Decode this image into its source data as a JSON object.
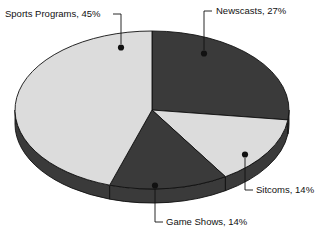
{
  "chart_data": {
    "type": "pie",
    "title": "",
    "categories": [
      "Newscasts",
      "Sitcoms",
      "Game Shows",
      "Sports Programs"
    ],
    "values": [
      27,
      14,
      14,
      45
    ],
    "unit": "%",
    "legend": "none",
    "labels_position": "outside-with-leader-lines",
    "style": "3d-pie",
    "slices": [
      {
        "name": "Newscasts",
        "value": 27,
        "label": "Newscasts, 27%",
        "color": "#3a3a3a",
        "start_angle_deg": 0,
        "end_angle_deg": 97.2
      },
      {
        "name": "Sitcoms",
        "value": 14,
        "label": "Sitcoms, 14%",
        "color": "#dcdcdc",
        "start_angle_deg": 97.2,
        "end_angle_deg": 147.6
      },
      {
        "name": "Game Shows",
        "value": 14,
        "label": "Game Shows, 14%",
        "color": "#3a3a3a",
        "start_angle_deg": 147.6,
        "end_angle_deg": 198.0
      },
      {
        "name": "Sports Programs",
        "value": 45,
        "label": "Sports Programs, 45%",
        "color": "#dcdcdc",
        "start_angle_deg": 198.0,
        "end_angle_deg": 360
      }
    ]
  },
  "labels": {
    "sports_programs": "Sports Programs, 45%",
    "newscasts": "Newscasts, 27%",
    "sitcoms": "Sitcoms, 14%",
    "game_shows": "Game Shows, 14%"
  },
  "colors": {
    "dark_slice": "#3a3a3a",
    "light_slice": "#dcdcdc",
    "side_wall": "#3a3a3a",
    "outline": "#111111",
    "background": "#ffffff",
    "text": "#111111"
  }
}
